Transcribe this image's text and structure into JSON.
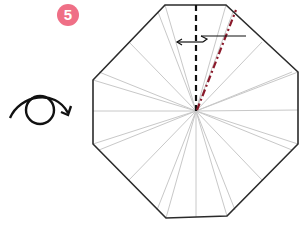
{
  "step": {
    "number": "5",
    "badge_color": "#ef6f86"
  },
  "diagram": {
    "instructions": {
      "turn_over_symbol": "rotate-over",
      "valley_fold": "dashed black line from top edge to center",
      "mountain_fold": "dash-dot red line from center to upper right",
      "fold_direction": "left"
    },
    "colors": {
      "outline": "#2b2b2b",
      "crease": "#c8c8c8",
      "valley_fold": "#111111",
      "mountain_fold": "#8b1a2b"
    }
  }
}
